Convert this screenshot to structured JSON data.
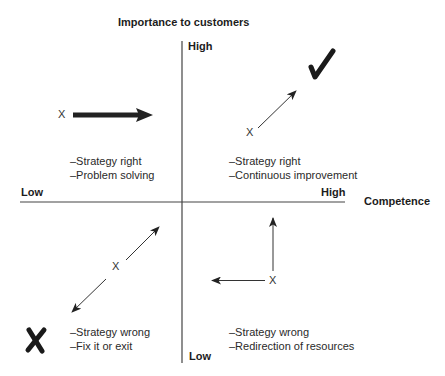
{
  "title": "Importance to customers",
  "axes": {
    "y_axis": {
      "label": "Importance to customers",
      "high": "High",
      "low": "Low"
    },
    "x_axis": {
      "label": "Competence",
      "high": "High",
      "low": "Low"
    }
  },
  "quadrants": [
    {
      "position": "top-left",
      "lines": [
        "–Strategy right",
        "–Problem solving"
      ],
      "marker": "X",
      "movement": "right"
    },
    {
      "position": "top-right",
      "lines": [
        "–Strategy right",
        "–Continuous improvement"
      ],
      "marker": "X",
      "movement": "up-right",
      "symbol": "checkmark"
    },
    {
      "position": "bottom-left",
      "lines": [
        "–Strategy wrong",
        "–Fix it or exit"
      ],
      "marker": "X",
      "movement": "up-right or down-left",
      "symbol": "cross"
    },
    {
      "position": "bottom-right",
      "lines": [
        "–Strategy wrong",
        "–Redirection of resources"
      ],
      "marker": "X",
      "movement": "up or left"
    }
  ],
  "colors": {
    "line": "#333333",
    "text": "#222222",
    "background": "#ffffff"
  }
}
